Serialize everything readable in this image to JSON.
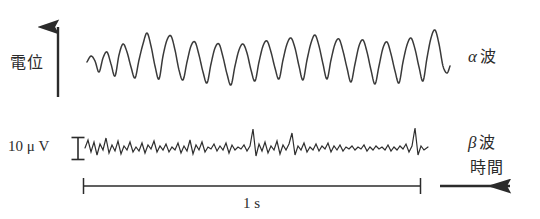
{
  "figure": {
    "background": "#ffffff",
    "trace_color": "#3a3a3a",
    "axis_color": "#2b2b2b",
    "width": 540,
    "height": 219
  },
  "axes": {
    "vertical": {
      "name": "potential-axis",
      "label": "電位",
      "arrow_direction": "up",
      "x": 58,
      "y_bottom": 97,
      "y_top": 22
    },
    "horizontal": {
      "name": "time-axis",
      "label": "時間",
      "arrow_direction": "right",
      "y": 186,
      "x_start": 440,
      "x_end": 518
    }
  },
  "scales": {
    "amplitude": {
      "name": "amplitude-scale-bar",
      "label": "10 μ V",
      "value": 10,
      "unit": "μV",
      "marker": "I-beam",
      "x": 78,
      "y_top": 137,
      "y_bottom": 160
    },
    "time": {
      "name": "time-scale-bar",
      "label": "1 s",
      "value": 1,
      "unit": "s",
      "x_start": 83,
      "x_end": 421,
      "y": 186
    }
  },
  "traces": [
    {
      "name": "alpha-wave-trace",
      "label": "α 波",
      "greek": "α",
      "kanji": "波",
      "description": "Alpha wave: large amplitude, ~10 Hz irregular oscillation",
      "baseline_y": 58,
      "x_start": 87,
      "x_end": 450,
      "approx_frequency_hz": 10,
      "relative_amplitude": "large"
    },
    {
      "name": "beta-wave-trace",
      "label": "β 波",
      "greek": "β",
      "kanji": "波",
      "description": "Beta wave: small amplitude, high frequency (~20-30 Hz) irregular activity",
      "baseline_y": 148,
      "x_start": 85,
      "x_end": 428,
      "approx_frequency_hz": 25,
      "relative_amplitude": "small"
    }
  ],
  "chart_data": {
    "type": "line",
    "title": "",
    "xlabel": "時間",
    "ylabel": "電位",
    "grid": false,
    "legend": "right-inline",
    "series": [
      {
        "name": "α 波",
        "baseline": 58,
        "points": [
          [
            87,
            62
          ],
          [
            91,
            56
          ],
          [
            95,
            61
          ],
          [
            99,
            72
          ],
          [
            103,
            58
          ],
          [
            107,
            52
          ],
          [
            111,
            64
          ],
          [
            115,
            76
          ],
          [
            119,
            55
          ],
          [
            123,
            44
          ],
          [
            127,
            52
          ],
          [
            131,
            67
          ],
          [
            135,
            78
          ],
          [
            139,
            60
          ],
          [
            143,
            44
          ],
          [
            147,
            33
          ],
          [
            151,
            46
          ],
          [
            155,
            66
          ],
          [
            159,
            79
          ],
          [
            163,
            56
          ],
          [
            167,
            40
          ],
          [
            171,
            36
          ],
          [
            175,
            50
          ],
          [
            179,
            70
          ],
          [
            183,
            80
          ],
          [
            187,
            62
          ],
          [
            191,
            46
          ],
          [
            195,
            42
          ],
          [
            199,
            55
          ],
          [
            203,
            72
          ],
          [
            207,
            83
          ],
          [
            211,
            64
          ],
          [
            215,
            48
          ],
          [
            219,
            44
          ],
          [
            223,
            57
          ],
          [
            227,
            74
          ],
          [
            231,
            85
          ],
          [
            235,
            66
          ],
          [
            239,
            50
          ],
          [
            243,
            44
          ],
          [
            247,
            53
          ],
          [
            251,
            70
          ],
          [
            255,
            81
          ],
          [
            259,
            62
          ],
          [
            263,
            46
          ],
          [
            267,
            41
          ],
          [
            271,
            52
          ],
          [
            275,
            68
          ],
          [
            279,
            79
          ],
          [
            283,
            60
          ],
          [
            287,
            44
          ],
          [
            291,
            38
          ],
          [
            295,
            48
          ],
          [
            299,
            66
          ],
          [
            303,
            80
          ],
          [
            307,
            60
          ],
          [
            311,
            43
          ],
          [
            315,
            35
          ],
          [
            319,
            46
          ],
          [
            323,
            64
          ],
          [
            327,
            79
          ],
          [
            331,
            60
          ],
          [
            335,
            44
          ],
          [
            339,
            39
          ],
          [
            343,
            51
          ],
          [
            347,
            68
          ],
          [
            351,
            82
          ],
          [
            355,
            64
          ],
          [
            359,
            46
          ],
          [
            363,
            40
          ],
          [
            367,
            52
          ],
          [
            371,
            70
          ],
          [
            375,
            84
          ],
          [
            379,
            66
          ],
          [
            383,
            48
          ],
          [
            387,
            42
          ],
          [
            391,
            54
          ],
          [
            395,
            71
          ],
          [
            399,
            83
          ],
          [
            403,
            62
          ],
          [
            407,
            45
          ],
          [
            411,
            38
          ],
          [
            415,
            49
          ],
          [
            419,
            67
          ],
          [
            423,
            81
          ],
          [
            427,
            58
          ],
          [
            431,
            38
          ],
          [
            435,
            30
          ],
          [
            439,
            44
          ],
          [
            443,
            66
          ],
          [
            447,
            73
          ],
          [
            450,
            66
          ]
        ]
      },
      {
        "name": "β 波",
        "baseline": 148,
        "points": [
          [
            85,
            148
          ],
          [
            88,
            140
          ],
          [
            91,
            152
          ],
          [
            94,
            142
          ],
          [
            97,
            155
          ],
          [
            100,
            144
          ],
          [
            103,
            150
          ],
          [
            106,
            138
          ],
          [
            109,
            153
          ],
          [
            112,
            145
          ],
          [
            115,
            151
          ],
          [
            118,
            141
          ],
          [
            121,
            154
          ],
          [
            124,
            146
          ],
          [
            127,
            150
          ],
          [
            130,
            142
          ],
          [
            133,
            152
          ],
          [
            136,
            147
          ],
          [
            139,
            151
          ],
          [
            142,
            143
          ],
          [
            145,
            153
          ],
          [
            148,
            145
          ],
          [
            151,
            149
          ],
          [
            154,
            141
          ],
          [
            157,
            152
          ],
          [
            160,
            146
          ],
          [
            163,
            150
          ],
          [
            166,
            144
          ],
          [
            169,
            152
          ],
          [
            172,
            147
          ],
          [
            175,
            150
          ],
          [
            178,
            143
          ],
          [
            181,
            153
          ],
          [
            184,
            146
          ],
          [
            187,
            151
          ],
          [
            190,
            140
          ],
          [
            193,
            154
          ],
          [
            196,
            145
          ],
          [
            199,
            150
          ],
          [
            202,
            142
          ],
          [
            205,
            152
          ],
          [
            208,
            147
          ],
          [
            211,
            149
          ],
          [
            214,
            144
          ],
          [
            217,
            151
          ],
          [
            220,
            146
          ],
          [
            223,
            150
          ],
          [
            226,
            143
          ],
          [
            229,
            153
          ],
          [
            232,
            145
          ],
          [
            235,
            150
          ],
          [
            238,
            147
          ],
          [
            241,
            149
          ],
          [
            244,
            145
          ],
          [
            247,
            151
          ],
          [
            250,
            146
          ],
          [
            253,
            129
          ],
          [
            256,
            156
          ],
          [
            259,
            144
          ],
          [
            262,
            151
          ],
          [
            265,
            142
          ],
          [
            268,
            153
          ],
          [
            271,
            146
          ],
          [
            274,
            150
          ],
          [
            277,
            141
          ],
          [
            280,
            154
          ],
          [
            283,
            145
          ],
          [
            286,
            150
          ],
          [
            289,
            144
          ],
          [
            292,
            133
          ],
          [
            295,
            155
          ],
          [
            298,
            146
          ],
          [
            301,
            150
          ],
          [
            304,
            143
          ],
          [
            307,
            152
          ],
          [
            310,
            147
          ],
          [
            313,
            150
          ],
          [
            316,
            144
          ],
          [
            319,
            151
          ],
          [
            322,
            146
          ],
          [
            325,
            149
          ],
          [
            328,
            143
          ],
          [
            331,
            152
          ],
          [
            334,
            146
          ],
          [
            337,
            150
          ],
          [
            340,
            145
          ],
          [
            343,
            151
          ],
          [
            346,
            147
          ],
          [
            349,
            149
          ],
          [
            352,
            146
          ],
          [
            355,
            150
          ],
          [
            358,
            147
          ],
          [
            361,
            149
          ],
          [
            364,
            145
          ],
          [
            367,
            151
          ],
          [
            370,
            147
          ],
          [
            373,
            150
          ],
          [
            376,
            146
          ],
          [
            379,
            149
          ],
          [
            382,
            147
          ],
          [
            385,
            150
          ],
          [
            388,
            145
          ],
          [
            391,
            151
          ],
          [
            394,
            147
          ],
          [
            397,
            150
          ],
          [
            400,
            146
          ],
          [
            403,
            149
          ],
          [
            406,
            144
          ],
          [
            409,
            152
          ],
          [
            412,
            146
          ],
          [
            415,
            128
          ],
          [
            418,
            155
          ],
          [
            421,
            146
          ],
          [
            424,
            150
          ],
          [
            428,
            147
          ]
        ]
      }
    ]
  }
}
